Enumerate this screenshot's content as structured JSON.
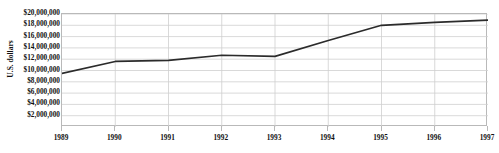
{
  "figure": {
    "title": "",
    "background_color": "#ffffff",
    "frame_color": "#b9b9b9",
    "gridline_color": "#cfcfcf",
    "line_color": "#2b2b2b"
  },
  "chart_data": {
    "type": "line",
    "title": "",
    "xlabel": "",
    "ylabel": "U.S. dollars",
    "categories": [
      "1989",
      "1990",
      "1991",
      "1992",
      "1993",
      "1994",
      "1995",
      "1996",
      "1997"
    ],
    "x": [
      1989,
      1990,
      1991,
      1992,
      1993,
      1994,
      1995,
      1996,
      1997
    ],
    "values": [
      9500000,
      11600000,
      11800000,
      12700000,
      12500000,
      15300000,
      18000000,
      18500000,
      18900000
    ],
    "series": [
      {
        "name": "U.S. dollars",
        "values": [
          9500000,
          11600000,
          11800000,
          12700000,
          12500000,
          15300000,
          18000000,
          18500000,
          18900000
        ]
      }
    ],
    "ylim": [
      0,
      20000000
    ],
    "xlim": [
      1989,
      1997
    ],
    "ytick_values": [
      2000000,
      4000000,
      6000000,
      8000000,
      10000000,
      12000000,
      14000000,
      16000000,
      18000000,
      20000000
    ],
    "ytick_labels": [
      "$2,000,000",
      "$4,000,000",
      "$6,000,000",
      "$8,000,000",
      "$10,000,000",
      "$12,000,000",
      "$14,000,000",
      "$16,000,000",
      "$18,000,000",
      "$20,000,000"
    ],
    "xtick_labels": [
      "1989",
      "1990",
      "1991",
      "1992",
      "1993",
      "1994",
      "1995",
      "1996",
      "1997"
    ],
    "grid": "both",
    "legend": "none",
    "annotations": []
  }
}
